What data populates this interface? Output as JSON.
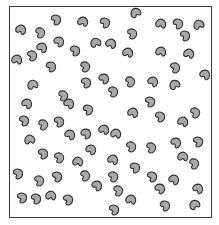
{
  "figure": {
    "colors": {
      "bean_fill": "#a9a9a9",
      "bean_outline": "#2f2f2f",
      "frame": "#3a3a3a",
      "background": "#ffffff"
    },
    "bean_count": 72
  },
  "beans": [
    {
      "x": 21,
      "y": 30,
      "r": -30
    },
    {
      "x": 40,
      "y": 33,
      "r": 20
    },
    {
      "x": 56,
      "y": 20,
      "r": 10
    },
    {
      "x": 59,
      "y": 42,
      "r": -10
    },
    {
      "x": 17,
      "y": 60,
      "r": -40
    },
    {
      "x": 32,
      "y": 56,
      "r": 15
    },
    {
      "x": 51,
      "y": 67,
      "r": 5
    },
    {
      "x": 42,
      "y": 48,
      "r": -20
    },
    {
      "x": 83,
      "y": 22,
      "r": -35
    },
    {
      "x": 105,
      "y": 23,
      "r": 5
    },
    {
      "x": 96,
      "y": 43,
      "r": -70
    },
    {
      "x": 75,
      "y": 51,
      "r": 10
    },
    {
      "x": 85,
      "y": 67,
      "r": 20
    },
    {
      "x": 111,
      "y": 44,
      "r": -30
    },
    {
      "x": 136,
      "y": 13,
      "r": -80
    },
    {
      "x": 132,
      "y": 34,
      "r": 15
    },
    {
      "x": 128,
      "y": 53,
      "r": -35
    },
    {
      "x": 161,
      "y": 24,
      "r": -40
    },
    {
      "x": 178,
      "y": 24,
      "r": 5
    },
    {
      "x": 199,
      "y": 25,
      "r": -75
    },
    {
      "x": 185,
      "y": 36,
      "r": 10
    },
    {
      "x": 161,
      "y": 52,
      "r": -40
    },
    {
      "x": 189,
      "y": 54,
      "r": -35
    },
    {
      "x": 175,
      "y": 68,
      "r": 15
    },
    {
      "x": 33,
      "y": 85,
      "r": -70
    },
    {
      "x": 27,
      "y": 104,
      "r": -20
    },
    {
      "x": 24,
      "y": 121,
      "r": 10
    },
    {
      "x": 43,
      "y": 125,
      "r": 20
    },
    {
      "x": 63,
      "y": 96,
      "r": 20
    },
    {
      "x": 69,
      "y": 104,
      "r": -20
    },
    {
      "x": 59,
      "y": 122,
      "r": 10
    },
    {
      "x": 86,
      "y": 83,
      "r": 10
    },
    {
      "x": 88,
      "y": 110,
      "r": 5
    },
    {
      "x": 113,
      "y": 92,
      "r": 15
    },
    {
      "x": 104,
      "y": 79,
      "r": -10
    },
    {
      "x": 130,
      "y": 82,
      "r": 20
    },
    {
      "x": 133,
      "y": 113,
      "r": -30
    },
    {
      "x": 153,
      "y": 82,
      "r": -20
    },
    {
      "x": 175,
      "y": 85,
      "r": -80
    },
    {
      "x": 150,
      "y": 102,
      "r": 10
    },
    {
      "x": 160,
      "y": 117,
      "r": 10
    },
    {
      "x": 183,
      "y": 122,
      "r": -30
    },
    {
      "x": 195,
      "y": 113,
      "r": 15
    },
    {
      "x": 205,
      "y": 75,
      "r": -20
    },
    {
      "x": 104,
      "y": 130,
      "r": -30
    },
    {
      "x": 116,
      "y": 134,
      "r": -40
    },
    {
      "x": 86,
      "y": 134,
      "r": -10
    },
    {
      "x": 70,
      "y": 135,
      "r": -20
    },
    {
      "x": 30,
      "y": 140,
      "r": -60
    },
    {
      "x": 43,
      "y": 154,
      "r": 10
    },
    {
      "x": 59,
      "y": 158,
      "r": 15
    },
    {
      "x": 78,
      "y": 162,
      "r": -45
    },
    {
      "x": 91,
      "y": 150,
      "r": -20
    },
    {
      "x": 18,
      "y": 174,
      "r": 10
    },
    {
      "x": 39,
      "y": 181,
      "r": 15
    },
    {
      "x": 57,
      "y": 177,
      "r": 10
    },
    {
      "x": 22,
      "y": 198,
      "r": 10
    },
    {
      "x": 36,
      "y": 199,
      "r": 10
    },
    {
      "x": 51,
      "y": 196,
      "r": -45
    },
    {
      "x": 68,
      "y": 200,
      "r": 10
    },
    {
      "x": 85,
      "y": 176,
      "r": 20
    },
    {
      "x": 97,
      "y": 186,
      "r": -10
    },
    {
      "x": 113,
      "y": 177,
      "r": 15
    },
    {
      "x": 135,
      "y": 168,
      "r": 5
    },
    {
      "x": 114,
      "y": 210,
      "r": 10
    },
    {
      "x": 131,
      "y": 200,
      "r": -40
    },
    {
      "x": 118,
      "y": 191,
      "r": 20
    },
    {
      "x": 152,
      "y": 177,
      "r": 10
    },
    {
      "x": 160,
      "y": 189,
      "r": -10
    },
    {
      "x": 165,
      "y": 206,
      "r": 5
    },
    {
      "x": 174,
      "y": 180,
      "r": -20
    },
    {
      "x": 183,
      "y": 157,
      "r": -45
    },
    {
      "x": 194,
      "y": 164,
      "r": 20
    },
    {
      "x": 198,
      "y": 189,
      "r": -20
    },
    {
      "x": 151,
      "y": 148,
      "r": 20
    },
    {
      "x": 176,
      "y": 143,
      "r": -10
    },
    {
      "x": 195,
      "y": 205,
      "r": -80
    },
    {
      "x": 131,
      "y": 147,
      "r": 15
    },
    {
      "x": 113,
      "y": 160,
      "r": -30
    },
    {
      "x": 198,
      "y": 142,
      "r": 10
    }
  ]
}
